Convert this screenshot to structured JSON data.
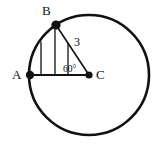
{
  "figure": {
    "canvas": {
      "width": 159,
      "height": 147,
      "background": "#ffffff"
    },
    "stroke_color": "#111111",
    "circle": {
      "center_label": "C",
      "center_x": 89,
      "center_y": 75,
      "radius_px": 60,
      "stroke_width": 2.6
    },
    "points": [
      {
        "name": "A",
        "label": "A",
        "x": 30,
        "y": 75,
        "label_x": 12,
        "label_y": 79,
        "dot_r": 4.2
      },
      {
        "name": "B",
        "label": "B",
        "x": 56,
        "y": 25,
        "label_x": 42,
        "label_y": 15,
        "dot_r": 4.6
      },
      {
        "name": "C",
        "label": "C",
        "x": 89,
        "y": 75,
        "label_x": 96,
        "label_y": 79,
        "dot_r": 3.6
      }
    ],
    "segments": [
      {
        "name": "segment-AC",
        "x1": 30,
        "y1": 75,
        "x2": 89,
        "y2": 75,
        "width": 1.9
      },
      {
        "name": "segment-BC",
        "x1": 56,
        "y1": 25,
        "x2": 89,
        "y2": 75,
        "width": 1.6
      }
    ],
    "hatch_lines": [
      {
        "name": "hatch-line-1",
        "x": 41,
        "y_top": 41.5,
        "y_bottom": 75
      },
      {
        "name": "hatch-line-2",
        "x": 55,
        "y_top": 25.6,
        "y_bottom": 75
      },
      {
        "name": "hatch-line-3",
        "x": 68,
        "y_top": 43.2,
        "y_bottom": 75
      }
    ],
    "hatch_width": 1.3,
    "labels": {
      "radius_label": "3",
      "radius_label_x": 74,
      "radius_label_y": 46,
      "angle_label": "60°",
      "angle_label_x": 63,
      "angle_label_y": 72
    },
    "arc_AB": {
      "description": "minor arc from A to B along the circle",
      "start_x": 30,
      "start_y": 75,
      "end_x": 56,
      "end_y": 25
    }
  }
}
